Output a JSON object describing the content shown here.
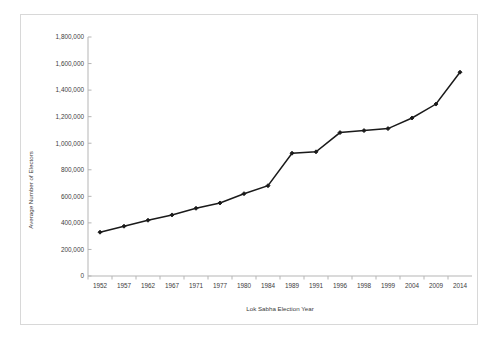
{
  "chart_data": {
    "type": "line",
    "title": "",
    "xlabel": "Lok Sabha Election Year",
    "ylabel": "Average Number of Electors",
    "categories": [
      "1952",
      "1957",
      "1962",
      "1967",
      "1971",
      "1977",
      "1980",
      "1984",
      "1989",
      "1991",
      "1996",
      "1998",
      "1999",
      "2004",
      "2009",
      "2014"
    ],
    "values": [
      330000,
      375000,
      420000,
      460000,
      510000,
      550000,
      620000,
      680000,
      925000,
      935000,
      1080000,
      1095000,
      1110000,
      1190000,
      1295000,
      1535000
    ],
    "series": [
      {
        "name": "Average Number of Electors",
        "values": [
          330000,
          375000,
          420000,
          460000,
          510000,
          550000,
          620000,
          680000,
          925000,
          935000,
          1080000,
          1095000,
          1110000,
          1190000,
          1295000,
          1535000
        ]
      }
    ],
    "ylim": [
      0,
      1800000
    ],
    "ytick_values": [
      0,
      200000,
      400000,
      600000,
      800000,
      1000000,
      1200000,
      1400000,
      1600000,
      1800000
    ],
    "ytick_labels": [
      "0",
      "200,000",
      "400,000",
      "600,000",
      "800,000",
      "1,000,000",
      "1,200,000",
      "1,400,000",
      "1,600,000",
      "1,800,000"
    ],
    "xtick_labels": [
      "1952",
      "1957",
      "1962",
      "1967",
      "1971",
      "1977",
      "1980",
      "1984",
      "1989",
      "1991",
      "1996",
      "1998",
      "1999",
      "2004",
      "2009",
      "2014"
    ],
    "grid": false,
    "legend": false,
    "legend_position": "none",
    "marker": "diamond",
    "line_color": "#1a1a1a",
    "marker_color": "#1a1a1a",
    "background_color": "#ffffff",
    "border_color": "#d8d8d8"
  }
}
